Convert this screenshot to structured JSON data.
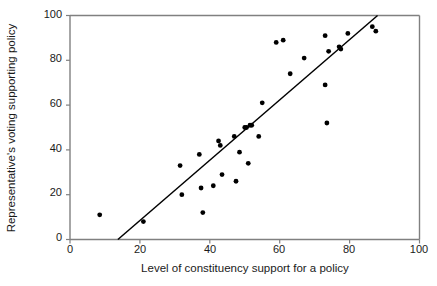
{
  "chart_data": {
    "type": "scatter",
    "title": "",
    "xlabel": "Level of constituency support for a policy",
    "ylabel": "Representative's voting supporting policy",
    "xlim": [
      0,
      100
    ],
    "ylim": [
      0,
      100
    ],
    "xticks": [
      0,
      20,
      40,
      60,
      80,
      100
    ],
    "yticks": [
      0,
      20,
      40,
      60,
      80,
      100
    ],
    "grid": false,
    "legend": null,
    "point_color": "#000000",
    "line_color": "#000000",
    "axis_color": "#808080",
    "points": [
      [
        8.5,
        11
      ],
      [
        21.0,
        8
      ],
      [
        31.5,
        33
      ],
      [
        32.0,
        20
      ],
      [
        37.0,
        38
      ],
      [
        37.5,
        23
      ],
      [
        38.0,
        12
      ],
      [
        41.0,
        24
      ],
      [
        42.5,
        44
      ],
      [
        43.0,
        42
      ],
      [
        43.5,
        29
      ],
      [
        47.0,
        46
      ],
      [
        47.5,
        26
      ],
      [
        48.5,
        39
      ],
      [
        50.0,
        50
      ],
      [
        50.5,
        50
      ],
      [
        51.0,
        34
      ],
      [
        51.5,
        51
      ],
      [
        52.0,
        51
      ],
      [
        54.0,
        46
      ],
      [
        55.0,
        61
      ],
      [
        59.0,
        88
      ],
      [
        61.0,
        89
      ],
      [
        63.0,
        74
      ],
      [
        67.0,
        81
      ],
      [
        73.0,
        91
      ],
      [
        73.0,
        69
      ],
      [
        73.5,
        52
      ],
      [
        74.0,
        84
      ],
      [
        77.0,
        86
      ],
      [
        77.5,
        85
      ],
      [
        79.5,
        92
      ],
      [
        86.5,
        95
      ],
      [
        87.5,
        93
      ]
    ],
    "trend_line": {
      "x_start": 13.7,
      "y_start": 0,
      "x_end": 88.0,
      "y_end": 100
    }
  },
  "axes": {
    "x_tick_labels": [
      "0",
      "20",
      "40",
      "60",
      "80",
      "100"
    ],
    "y_tick_labels": [
      "0",
      "20",
      "40",
      "60",
      "80",
      "100"
    ]
  }
}
